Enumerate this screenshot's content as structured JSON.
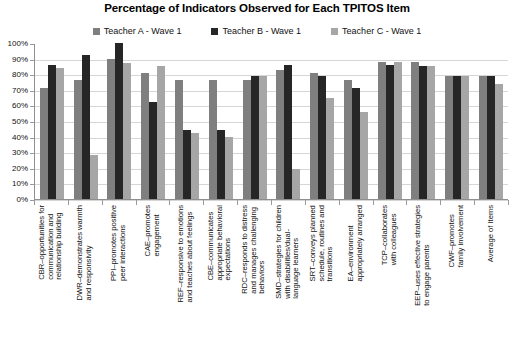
{
  "chart": {
    "title": "Percentage of Indicators Observed for Each TPITOS Item",
    "legend": [
      {
        "label": "Teacher A - Wave 1",
        "color": "#7f7f7f"
      },
      {
        "label": "Teacher B - Wave 1",
        "color": "#262626"
      },
      {
        "label": "Teacher C - Wave 1",
        "color": "#a6a6a6"
      }
    ],
    "y_tick_labels": [
      "100%",
      "90%",
      "80%",
      "70%",
      "60%",
      "50%",
      "40%",
      "30%",
      "20%",
      "10%",
      "0%"
    ]
  },
  "chart_data": {
    "type": "bar",
    "title": "Percentage of Indicators Observed for Each TPITOS Item",
    "xlabel": "",
    "ylabel": "",
    "ylim": [
      0,
      100
    ],
    "yticks": [
      0,
      10,
      20,
      30,
      40,
      50,
      60,
      70,
      80,
      90,
      100
    ],
    "ytick_labels": [
      "0%",
      "10%",
      "20%",
      "30%",
      "40%",
      "50%",
      "60%",
      "70%",
      "80%",
      "90%",
      "100%"
    ],
    "grid": true,
    "legend_position": "top-center",
    "units": "percent",
    "categories": [
      "CBR–opportunities for communication and relationship building",
      "DWR–demonstrates warmth and responsivity",
      "PPI–promotes positive peer interactions",
      "CAE–promotes engagement",
      "REF–responsive to emotions and teaches about feelings",
      "CBE–communicates appropriate behavioral expectations",
      "RDC–responds to distress and manages challenging behaviors",
      "SMD–strategies for children with disabilities/dual-language learners",
      "SRT–conveys planned schedule, routines and transitions",
      "EA–environment appropriately arranged",
      "TCP–collaborates with colleagues",
      "EEP–uses effective strategies to engage parents",
      "CWF–promotes family involvement",
      "Average of Items"
    ],
    "category_lines": [
      [
        "CBR–opportunities for",
        "communication and",
        "relationship building"
      ],
      [
        "DWR–demonstrates warmth",
        "and responsivity"
      ],
      [
        "PPI–promotes positive",
        "peer interactions"
      ],
      [
        "CAE–promotes",
        "engagement"
      ],
      [
        "REF–responsive to emotions",
        "and teaches about feelings"
      ],
      [
        "CBE–communicates",
        "appropriate behavioral",
        "expectations"
      ],
      [
        "RDC–responds to distress",
        "and manages challenging",
        "behaviors"
      ],
      [
        "SMD–strategies for children",
        "with disabilities/dual-",
        "language learners"
      ],
      [
        "SRT–conveys planned",
        "schedule, routines and",
        "transitions"
      ],
      [
        "EA–environment",
        "appropriately arranged"
      ],
      [
        "TCP–collaborates",
        "with colleagues"
      ],
      [
        "EEP–uses effective strategies",
        "to engage parents"
      ],
      [
        "CWF–promotes",
        "family involvement"
      ],
      [
        "Average of Items"
      ]
    ],
    "series": [
      {
        "name": "Teacher A - Wave 1",
        "color": "#7f7f7f",
        "values": [
          71,
          76,
          90,
          81,
          76,
          76,
          76,
          83,
          81,
          76,
          88,
          88,
          79,
          79
        ]
      },
      {
        "name": "Teacher B - Wave 1",
        "color": "#262626",
        "values": [
          86,
          92,
          100,
          62,
          44,
          44,
          79,
          86,
          79,
          71,
          86,
          85,
          79,
          79
        ]
      },
      {
        "name": "Teacher C - Wave 1",
        "color": "#a6a6a6",
        "values": [
          84,
          28,
          87,
          85,
          42,
          40,
          79,
          19,
          65,
          56,
          88,
          85,
          79,
          74
        ]
      }
    ]
  }
}
